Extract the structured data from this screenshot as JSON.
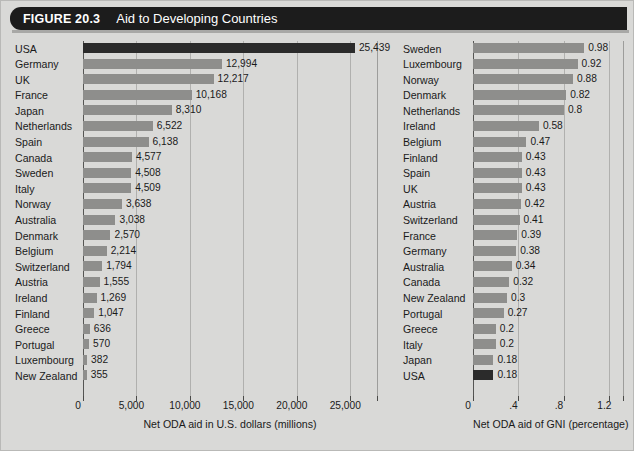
{
  "header": {
    "figure_number": "FIGURE 20.3",
    "title": "Aid to Developing Countries"
  },
  "colors": {
    "header_bg": "#1c1c1c",
    "header_text": "#ffffff",
    "page_bg": "#d9d9d7",
    "bar": "#8e8e8c",
    "bar_highlight": "#2b2b2b",
    "gridline": "#b0b0ae"
  },
  "chart_data": [
    {
      "type": "bar",
      "orientation": "horizontal",
      "id": "oda-absolute",
      "title": "",
      "xlabel": "Net ODA aid in U.S. dollars (millions)",
      "ylabel": "",
      "xlim": [
        0,
        27500
      ],
      "xticks": [
        0,
        5000,
        10000,
        15000,
        20000,
        25000
      ],
      "xtick_labels": [
        "0",
        "5,000",
        "10,000",
        "15,000",
        "20,000",
        "25,000"
      ],
      "grid": true,
      "legend": "none",
      "highlight_category": "USA",
      "categories": [
        "USA",
        "Germany",
        "UK",
        "France",
        "Japan",
        "Netherlands",
        "Spain",
        "Canada",
        "Sweden",
        "Italy",
        "Norway",
        "Australia",
        "Denmark",
        "Belgium",
        "Switzerland",
        "Austria",
        "Ireland",
        "Finland",
        "Greece",
        "Portugal",
        "Luxembourg",
        "New Zealand"
      ],
      "values": [
        25439,
        12994,
        12217,
        10168,
        8310,
        6522,
        6138,
        4577,
        4508,
        4509,
        3638,
        3038,
        2570,
        2214,
        1794,
        1555,
        1269,
        1047,
        636,
        570,
        382,
        355
      ],
      "value_labels": [
        "25,439",
        "12,994",
        "12,217",
        "10,168",
        "8,310",
        "6,522",
        "6,138",
        "4,577",
        "4,508",
        "4,509",
        "3,638",
        "3,038",
        "2,570",
        "2,214",
        "1,794",
        "1,555",
        "1,269",
        "1,047",
        "636",
        "570",
        "382",
        "355"
      ]
    },
    {
      "type": "bar",
      "orientation": "horizontal",
      "id": "oda-gni-percentage",
      "title": "",
      "xlabel": "Net ODA aid of GNI (percentage)",
      "ylabel": "",
      "xlim": [
        0,
        1.32
      ],
      "xticks": [
        0,
        0.4,
        0.8,
        1.2
      ],
      "xtick_labels": [
        "0",
        ".4",
        ".8",
        "1.2"
      ],
      "grid": true,
      "legend": "none",
      "highlight_category": "USA",
      "categories": [
        "Sweden",
        "Luxembourg",
        "Norway",
        "Denmark",
        "Netherlands",
        "Ireland",
        "Belgium",
        "Finland",
        "Spain",
        "UK",
        "Austria",
        "Switzerland",
        "France",
        "Germany",
        "Australia",
        "Canada",
        "New Zealand",
        "Portugal",
        "Greece",
        "Italy",
        "Japan",
        "USA"
      ],
      "values": [
        0.98,
        0.92,
        0.88,
        0.82,
        0.8,
        0.58,
        0.47,
        0.43,
        0.43,
        0.43,
        0.42,
        0.41,
        0.39,
        0.38,
        0.34,
        0.32,
        0.3,
        0.27,
        0.2,
        0.2,
        0.18,
        0.18
      ],
      "value_labels": [
        "0.98",
        "0.92",
        "0.88",
        "0.82",
        "0.8",
        "0.58",
        "0.47",
        "0.43",
        "0.43",
        "0.43",
        "0.42",
        "0.41",
        "0.39",
        "0.38",
        "0.34",
        "0.32",
        "0.3",
        "0.27",
        "0.2",
        "0.2",
        "0.18",
        "0.18"
      ]
    }
  ]
}
